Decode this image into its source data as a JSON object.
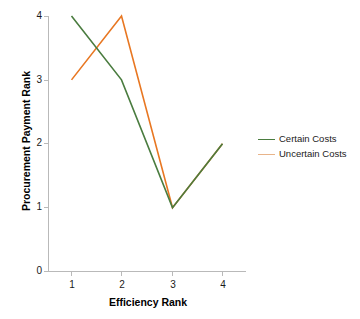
{
  "chart_data": {
    "type": "line",
    "title": "",
    "subtitle": "",
    "xlabel": "Efficiency Rank",
    "ylabel": "Procurement Payment Rank",
    "x": [
      1,
      2,
      3,
      4
    ],
    "xticklabels": [
      "1",
      "2",
      "3",
      "4"
    ],
    "yticklabels": [
      "0",
      "1",
      "2",
      "3",
      "4"
    ],
    "xlim": [
      0.6,
      4.5
    ],
    "ylim": [
      0,
      4
    ],
    "grid": false,
    "legend_position": "right",
    "series": [
      {
        "name": "Certain Costs",
        "color": "#4a7c3f",
        "values": [
          4,
          3,
          1,
          2
        ]
      },
      {
        "name": "Uncertain Costs",
        "color": "#e87722",
        "legend_color": "#e8b48a",
        "values": [
          3,
          4,
          1,
          2
        ]
      }
    ],
    "annotations": []
  },
  "legend": {
    "items": [
      {
        "label": "Certain Costs"
      },
      {
        "label": "Uncertain Costs"
      }
    ]
  },
  "axes": {
    "y_title": "Procurement Payment Rank",
    "x_title": "Efficiency Rank",
    "y_ticks": [
      "4",
      "3",
      "2",
      "1",
      "0"
    ],
    "x_ticks": [
      "1",
      "2",
      "3",
      "4"
    ]
  },
  "colors": {
    "certain": "#4a7c3f",
    "uncertain": "#e87722",
    "axis": "#b9b9b9",
    "text": "#1a1a1a",
    "background": "#ffffff"
  }
}
